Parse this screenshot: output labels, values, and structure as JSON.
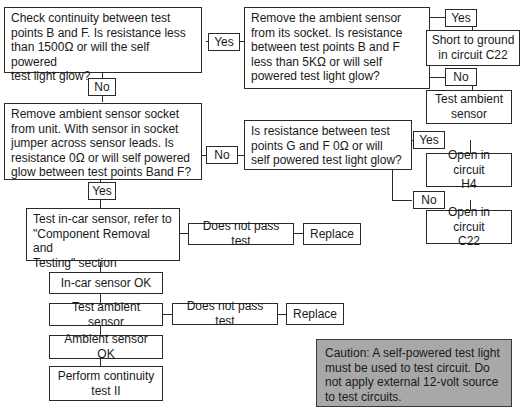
{
  "flowchart": {
    "q1": "Check continuity between test\npoints B and F. Is resistance less\nthan 1500Ω or will the self powered\ntest light glow?",
    "q1_yes": "Yes",
    "q1_no": "No",
    "q2": "Remove the ambient sensor\nfrom its socket. Is resistance\nbetween test points B and F\nless than 5KΩ or will self\npowered test light glow?",
    "q2_yes": "Yes",
    "q2_yes_result": "Short to ground\nin circuit C22",
    "q2_no": "No",
    "q2_no_result": "Test ambient\nsensor",
    "q3": "Remove ambient sensor socket\nfrom unit. With sensor in socket\njumper across sensor leads. Is\nresistance 0Ω or will self powered\nglow between test points Band F?",
    "q3_no": "No",
    "q3_yes": "Yes",
    "q4": "Is resistance between test\npoints G and F 0Ω or will\nself powered test light glow?",
    "q4_yes": "Yes",
    "q4_yes_result": "Open in circuit\nH4",
    "q4_no": "No",
    "q4_no_result": "Open in circuit\nC22",
    "step_incar": "Test in-car sensor, refer to\n\"Component Removal and\nTesting\" section",
    "incar_fail": "Does not pass test",
    "incar_replace": "Replace",
    "incar_ok": "In-car sensor OK",
    "step_ambient": "Test ambient sensor",
    "ambient_fail": "Does not pass test",
    "ambient_replace": "Replace",
    "ambient_ok": "Ambient sensor OK",
    "final_step": "Perform continuity\ntest II",
    "caution": "Caution: A self-powered test light\nmust be used to test circuit. Do\nnot apply external 12-volt source\nto test circuits."
  }
}
